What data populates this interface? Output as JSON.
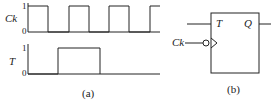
{
  "figure_a": {
    "caption": "(a)",
    "signals": [
      {
        "name": "Ck",
        "high_label": "1",
        "low_label": "0"
      },
      {
        "name": "T",
        "high_label": "1",
        "low_label": "0"
      }
    ]
  },
  "figure_b": {
    "caption": "(b)",
    "block": {
      "input_T": "T",
      "output_Q": "Q",
      "clock_input": "Ck",
      "clock_type": "negative-edge triggered (bubble + triangle)"
    }
  },
  "colors": {
    "line": "#222222",
    "background": "#ffffff"
  }
}
